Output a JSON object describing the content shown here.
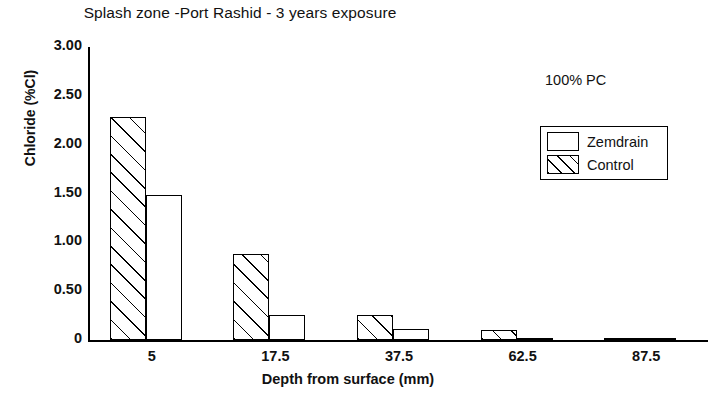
{
  "chart_data": {
    "type": "bar",
    "title": "Splash zone -Port Rashid - 3 years exposure",
    "xlabel": "Depth from surface (mm)",
    "ylabel": "Chloride (%Cl)",
    "categories": [
      "5",
      "17.5",
      "37.5",
      "62.5",
      "87.5"
    ],
    "series": [
      {
        "name": "Zemdrain",
        "values": [
          1.48,
          0.26,
          0.11,
          0.02,
          0.02
        ],
        "fill": "white"
      },
      {
        "name": "Control",
        "values": [
          2.28,
          0.88,
          0.26,
          0.1,
          0.02
        ],
        "fill": "hatched"
      }
    ],
    "series_draw_order": [
      "Control",
      "Zemdrain"
    ],
    "ylim": [
      0,
      3.0
    ],
    "yticks": [
      "0",
      "0.50",
      "1.00",
      "1.50",
      "2.00",
      "2.50",
      "3.00"
    ],
    "ytick_values": [
      0,
      0.5,
      1.0,
      1.5,
      2.0,
      2.5,
      3.0
    ],
    "grid": false,
    "legend_position": "upper-right",
    "annotations": [
      {
        "text": "100% PC",
        "position": "upper-right"
      }
    ],
    "colors": {
      "axis": "#000000",
      "bar_outline": "#000000",
      "bar_fill": "#ffffff",
      "hatch": "#000000",
      "background": "#ffffff"
    }
  },
  "legend": {
    "items": [
      {
        "label": "Zemdrain",
        "fill": "white"
      },
      {
        "label": "Control",
        "fill": "hatched"
      }
    ]
  },
  "annotation": {
    "text": "100% PC"
  }
}
